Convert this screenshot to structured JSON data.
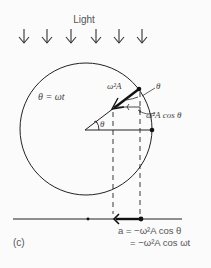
{
  "title": "Light",
  "panel_label": "(c)",
  "labels": {
    "theta_def": "θ = ωt",
    "vector": "ω²A",
    "theta_top": "θ",
    "component": "ω²A cos θ",
    "theta_center": "θ",
    "eq_line1": "a = −ω²A cos θ",
    "eq_line2": "= −ω²A cos ωt"
  },
  "light_arrows": 6,
  "colors": {
    "stroke": "#222222",
    "text": "#555555",
    "background": "#fbfbfb"
  }
}
